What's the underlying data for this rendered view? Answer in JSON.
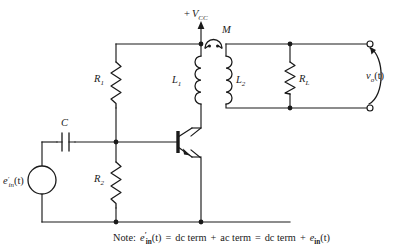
{
  "figure": {
    "background_color": "#ffffff",
    "line_color": "#1a1a1a"
  },
  "supply": {
    "label_sign": "+",
    "label_symbol": "V",
    "label_subscript": "CC",
    "full_label": "+ V_CC",
    "arrow_direction": "up"
  },
  "transformer": {
    "mutual_label": "M",
    "primary": {
      "symbol": "L",
      "subscript": "1"
    },
    "secondary": {
      "symbol": "L",
      "subscript": "2"
    },
    "coupling_icon": "mutual-coupling-arc"
  },
  "resistors": {
    "r1": {
      "symbol": "R",
      "subscript": "1"
    },
    "r2": {
      "symbol": "R",
      "subscript": "2"
    },
    "rl": {
      "symbol": "R",
      "subscript": "L"
    }
  },
  "capacitor": {
    "symbol": "C"
  },
  "source": {
    "symbol": "e",
    "prime": "′",
    "subscript": "in",
    "argument": "(t)",
    "full_label": "e′in(t)"
  },
  "output": {
    "symbol": "v",
    "subscript": "o",
    "argument": "(t)",
    "full_label": "vo(t)",
    "terminal_top": "output-terminal-top",
    "terminal_bottom": "output-terminal-bottom"
  },
  "transistor": {
    "type": "npn-bjt",
    "terminals": [
      "base",
      "collector",
      "emitter"
    ]
  },
  "note": {
    "prefix": "Note:",
    "lhs_symbol": "e",
    "lhs_prime": "′",
    "lhs_subscript": "in",
    "lhs_arg": "(t)",
    "eq1": "=",
    "term1": "dc term",
    "plus1": "+",
    "term2": "ac term",
    "eq2": "=",
    "term3": "dc term",
    "plus2": "+",
    "rhs_symbol": "e",
    "rhs_subscript": "in",
    "rhs_arg": "(t)",
    "full_text": "Note: e′in(t) = dc term + ac term = dc term + ein(t)"
  }
}
